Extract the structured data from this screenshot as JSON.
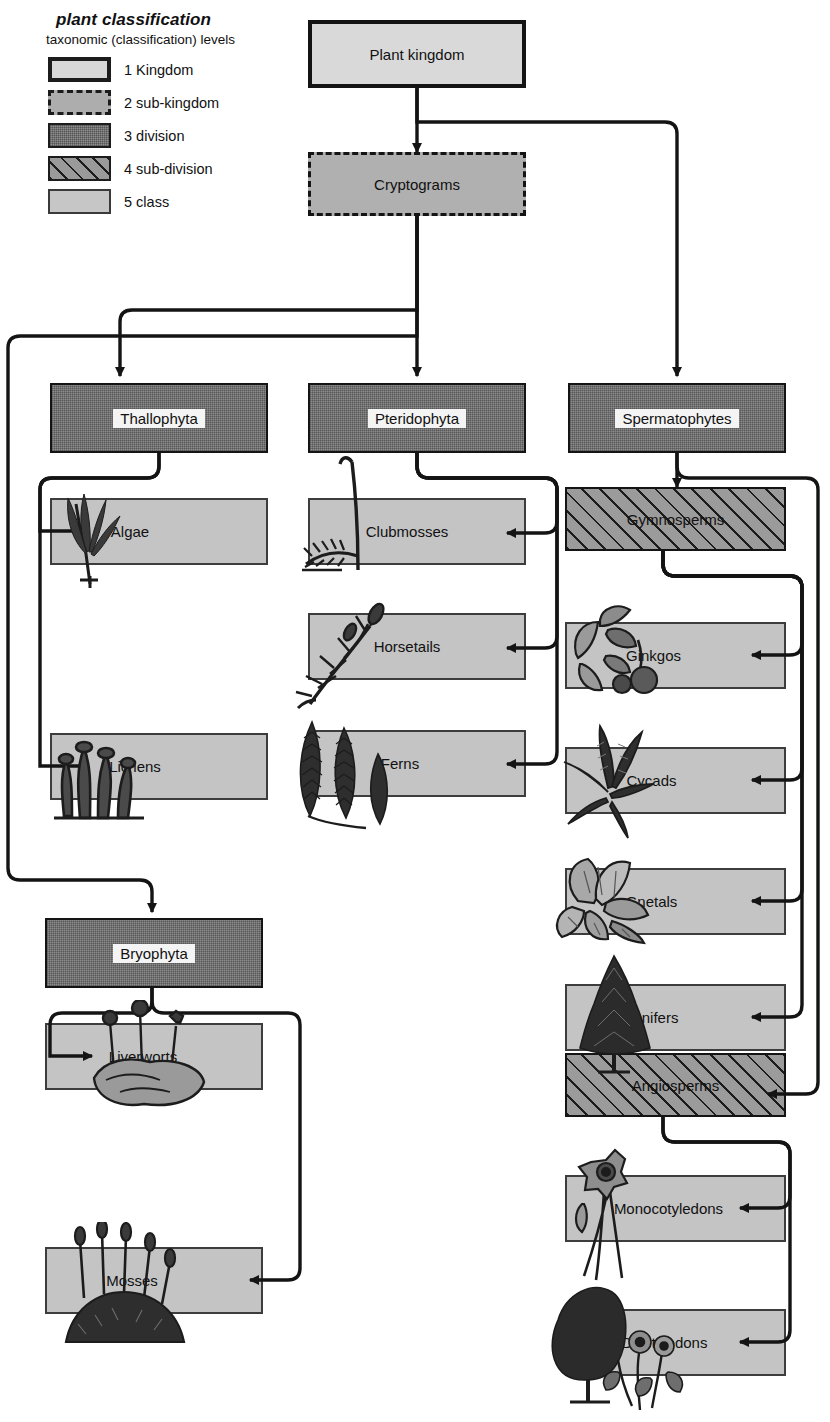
{
  "legend": {
    "title": "plant classification",
    "subtitle": "taxonomic (classification) levels",
    "items": [
      {
        "num": "1",
        "label": "Kingdom",
        "level": "lv1"
      },
      {
        "num": "2",
        "label": "sub-kingdom",
        "level": "lv2"
      },
      {
        "num": "3",
        "label": "division",
        "level": "lv3"
      },
      {
        "num": "4",
        "label": "sub-division",
        "level": "lv4"
      },
      {
        "num": "5",
        "label": "class",
        "level": "lv5"
      }
    ]
  },
  "nodes": {
    "kingdom": {
      "label": "Plant kingdom",
      "level": 1
    },
    "cryptograms": {
      "label": "Cryptograms",
      "level": 2
    },
    "thallophyta": {
      "label": "Thallophyta",
      "level": 3
    },
    "pteridophyta": {
      "label": "Pteridophyta",
      "level": 3
    },
    "spermatophytes": {
      "label": "Spermatophytes",
      "level": 3
    },
    "bryophyta": {
      "label": "Bryophyta",
      "level": 3
    },
    "gymnosperms": {
      "label": "Gymnosperms",
      "level": 4
    },
    "angiosperms": {
      "label": "Angiosperms",
      "level": 4
    },
    "algae": {
      "label": "Algae",
      "level": 5
    },
    "lichens": {
      "label": "Lichens",
      "level": 5
    },
    "clubmosses": {
      "label": "Clubmosses",
      "level": 5
    },
    "horsetails": {
      "label": "Horsetails",
      "level": 5
    },
    "ferns": {
      "label": "Ferns",
      "level": 5
    },
    "liverworts": {
      "label": "Liverworts",
      "level": 5
    },
    "mosses": {
      "label": "Mosses",
      "level": 5
    },
    "ginkgos": {
      "label": "Ginkgos",
      "level": 5
    },
    "cycads": {
      "label": "Cycads",
      "level": 5
    },
    "gnetals": {
      "label": "Gnetals",
      "level": 5
    },
    "conifers": {
      "label": "Conifers",
      "level": 5
    },
    "monocotyledons": {
      "label": "Monocotyledons",
      "level": 5
    },
    "dicotyledons": {
      "label": "Dicotyledons",
      "level": 5
    }
  },
  "edges": [
    {
      "from": "kingdom",
      "to": "cryptograms"
    },
    {
      "from": "kingdom",
      "to": "spermatophytes"
    },
    {
      "from": "cryptograms",
      "to": "thallophyta"
    },
    {
      "from": "cryptograms",
      "to": "pteridophyta"
    },
    {
      "from": "cryptograms",
      "to": "bryophyta"
    },
    {
      "from": "thallophyta",
      "to": "algae"
    },
    {
      "from": "thallophyta",
      "to": "lichens"
    },
    {
      "from": "pteridophyta",
      "to": "clubmosses"
    },
    {
      "from": "pteridophyta",
      "to": "horsetails"
    },
    {
      "from": "pteridophyta",
      "to": "ferns"
    },
    {
      "from": "bryophyta",
      "to": "liverworts"
    },
    {
      "from": "bryophyta",
      "to": "mosses"
    },
    {
      "from": "spermatophytes",
      "to": "gymnosperms"
    },
    {
      "from": "spermatophytes",
      "to": "angiosperms"
    },
    {
      "from": "gymnosperms",
      "to": "ginkgos"
    },
    {
      "from": "gymnosperms",
      "to": "cycads"
    },
    {
      "from": "gymnosperms",
      "to": "gnetals"
    },
    {
      "from": "gymnosperms",
      "to": "conifers"
    },
    {
      "from": "angiosperms",
      "to": "monocotyledons"
    },
    {
      "from": "angiosperms",
      "to": "dicotyledons"
    }
  ],
  "colors": {
    "kingdom_fill": "#d9d9d9",
    "subkingdom_fill": "#b0b0b0",
    "division_fill": "#8c8c8c",
    "subdivision_fill": "#9b9b9b",
    "class_fill": "#c4c4c4",
    "line": "#141414",
    "page_background": "#ffffff"
  }
}
